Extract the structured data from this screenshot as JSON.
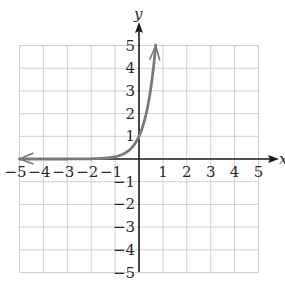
{
  "chart_data": {
    "type": "line",
    "title": "",
    "xlabel": "x",
    "ylabel": "y",
    "xlim": [
      -5,
      5
    ],
    "ylim": [
      -5,
      5
    ],
    "grid": true,
    "legend": null,
    "x_ticks": [
      "-5",
      "-4",
      "-3",
      "-2",
      "-1",
      "1",
      "2",
      "3",
      "4",
      "5"
    ],
    "y_ticks": [
      "5",
      "4",
      "3",
      "2",
      "1",
      "-1",
      "-2",
      "-3",
      "-4",
      "-5"
    ],
    "series": [
      {
        "name": "exponential curve",
        "function": "y = 10^x",
        "color": "#7a7a7a",
        "arrows": [
          "left",
          "up"
        ],
        "x": [
          -5,
          -4,
          -3,
          -2,
          -1,
          -0.5,
          0,
          0.3,
          0.5,
          0.7
        ],
        "y": [
          1e-05,
          0.0001,
          0.001,
          0.01,
          0.1,
          0.32,
          1,
          2,
          3.16,
          5
        ]
      }
    ]
  },
  "colors": {
    "grid": "#cfcfcf",
    "axis": "#1a1a1a",
    "curve": "#7a7a7a"
  }
}
